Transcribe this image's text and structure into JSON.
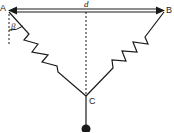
{
  "diagram": {
    "labels": {
      "point_a": "A",
      "point_b": "B",
      "point_c": "C",
      "distance": "d",
      "angle": "β"
    },
    "colors": {
      "stroke": "#1a1a1a",
      "background": "#ffffff"
    }
  }
}
